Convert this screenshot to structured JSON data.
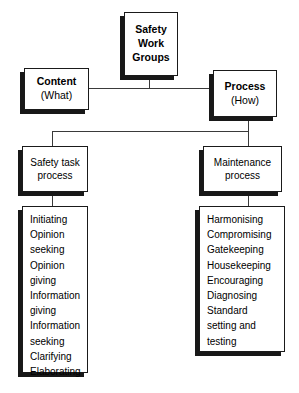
{
  "diagram": {
    "title_box": {
      "lines": [
        "Safety",
        "Work",
        "Groups"
      ]
    },
    "branches": [
      {
        "title": "Content",
        "subtitle": "(What)"
      },
      {
        "title": "Process",
        "subtitle": "(How)"
      }
    ],
    "processes": [
      {
        "name": "safety-task-process",
        "lines": [
          "Safety task",
          "process"
        ],
        "items": [
          "Initiating",
          "Opinion",
          "seeking",
          "Opinion",
          "giving",
          "Information",
          "giving",
          "Information",
          "seeking",
          "Clarifying",
          "Elaborating"
        ]
      },
      {
        "name": "maintenance-process",
        "lines": [
          "Maintenance",
          "process"
        ],
        "items": [
          "Harmonising",
          "Compromising",
          "Gatekeeping",
          "Housekeeping",
          "Encouraging",
          "Diagnosing",
          "Standard",
          "setting and",
          "testing"
        ]
      }
    ],
    "colors": {
      "background": "#ffffff",
      "border": "#1a1a1a",
      "shadow": "#181818",
      "connector": "#3a3a3a",
      "text": "#000000"
    }
  }
}
